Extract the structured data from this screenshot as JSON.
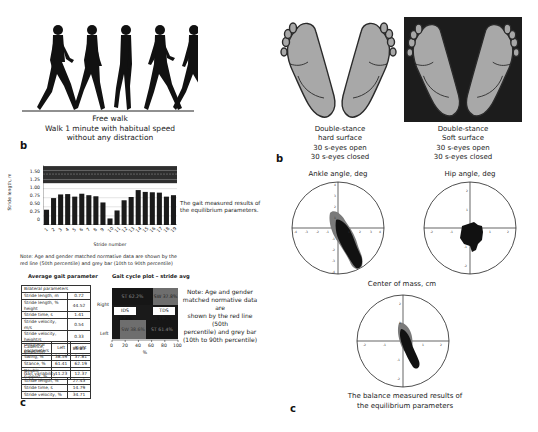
{
  "left_panel": {
    "walk_caption": {
      "line1": "Free walk",
      "line2": "Walk 1 minute with habitual speed",
      "line3": "without any distraction"
    },
    "label_b": "b",
    "label_c": "c",
    "stride_chart_side_text": {
      "line1": "The gait measured results of",
      "line2": "the equilibrium parameters."
    },
    "note": {
      "line1": "Note: Age and gender matched normative data are shown by the",
      "line2": "red line (50th percentile) and grey bar (10th to 90th percentile)"
    },
    "avg_gait_title": "Average gait parameter",
    "gait_cycle_title": "Gait cycle plot – stride avg",
    "bilateral_table": {
      "header": "Bilateral parameters",
      "rows": [
        {
          "label": "Stride length, m",
          "value": "0.72"
        },
        {
          "label": "Stride length, % height",
          "value": "44.52"
        },
        {
          "label": "Stride time, s",
          "value": "1.41"
        },
        {
          "label": "Stride velocity, m/s",
          "value": "0.54"
        },
        {
          "label": "Stride velocity, height/s",
          "value": "0.33"
        },
        {
          "label": "Cadence, steps/min",
          "value": "86.83"
        }
      ]
    },
    "unilateral_table": {
      "headers": [
        "Unilateral parameters",
        "Left",
        "Right"
      ],
      "rows": [
        {
          "label": "Swing, %",
          "left": "38.59",
          "right": "37.81"
        },
        {
          "label": "Stance, %",
          "left": "61.41",
          "right": "62.19"
        },
        {
          "label": "Double support, %",
          "left": "11.23",
          "right": "12.37"
        }
      ]
    },
    "variability_table": {
      "header": "Gait variability",
      "rows": [
        {
          "label": "Stride length, %",
          "value": "27.43"
        },
        {
          "label": "Stride time, s",
          "value": "14.79"
        },
        {
          "label": "Stride velocity, %",
          "value": "34.71"
        }
      ]
    },
    "gait_cycle_plot": {
      "row_labels": [
        "Right",
        "Left"
      ],
      "segments": {
        "right_stance": "ST 62.2%",
        "right_swing": "SW 37.8%",
        "ids": "IDS 12.4%",
        "tds": "TDS 11.2%",
        "left_swing": "SW 38.6%",
        "left_stance": "ST 61.4%"
      },
      "x_ticks": [
        "0",
        "20",
        "40",
        "60",
        "80",
        "100"
      ],
      "x_label": "%"
    },
    "gait_cycle_side_note": {
      "line1": "Note: Age and gender",
      "line2": "matched normative data are",
      "line3": "shown by the red line (50th",
      "line4": "percentile) and grey bar",
      "line5": "(10th to 90th percentile)"
    }
  },
  "right_panel": {
    "hard_surface_caption": {
      "line1": "Double-stance",
      "line2": "hard surface",
      "line3": "30 s-eyes open",
      "line4": "30 s-eyes closed"
    },
    "soft_surface_caption": {
      "line1": "Double-stance",
      "line2": "Soft surface",
      "line3": "30 s-eyes open",
      "line4": "30 s-eyes closed"
    },
    "label_b": "b",
    "label_c": "c",
    "ankle_title": "Ankle angle, deg",
    "hip_title": "Hip angle, deg",
    "com_title": "Center of mass, cm",
    "bottom_caption": {
      "line1": "The balance measured results of",
      "line2": "the equilibrium parameters"
    }
  },
  "chart_data": [
    {
      "type": "bar",
      "title": "",
      "xlabel": "Stride number",
      "ylabel": "Stride length, m",
      "categories": [
        "1",
        "2",
        "3",
        "4",
        "5",
        "6",
        "7",
        "8",
        "9",
        "10",
        "11",
        "12",
        "13",
        "14",
        "15",
        "16",
        "17",
        "18",
        "19"
      ],
      "values": [
        0.42,
        0.74,
        0.84,
        0.85,
        0.78,
        0.86,
        0.82,
        0.79,
        0.62,
        0.18,
        0.4,
        0.68,
        0.77,
        0.96,
        0.91,
        0.9,
        0.89,
        0.78,
        0.82
      ],
      "yticks": [
        "0",
        "0.25",
        "0.50",
        "0.75",
        "1.00",
        "1.25",
        "1.50"
      ],
      "ylim": [
        0,
        1.65
      ],
      "normative_band": {
        "low": 1.15,
        "high": 1.62,
        "median": 1.4
      },
      "grid": true
    },
    {
      "type": "scatter",
      "title": "Ankle angle, deg",
      "xlim": [
        -4,
        4
      ],
      "ylim": [
        -4,
        4
      ],
      "xticks": [
        "-4",
        "-3",
        "-2",
        "-1",
        "1",
        "2",
        "3",
        "4"
      ],
      "yticks": [
        "4",
        "3",
        "2",
        "1",
        "-1",
        "-2",
        "-3",
        "-4"
      ]
    },
    {
      "type": "scatter",
      "title": "Hip angle, deg",
      "xlim": [
        -2,
        2
      ],
      "ylim": [
        -2,
        2
      ],
      "xticks": [
        "-2",
        "-1",
        "1",
        "2"
      ],
      "yticks": [
        "2",
        "1",
        "-1",
        "-2"
      ]
    },
    {
      "type": "scatter",
      "title": "Center of mass, cm",
      "xlim": [
        -2,
        2
      ],
      "ylim": [
        -2,
        2
      ],
      "xticks": [
        "-2",
        "-1",
        "1",
        "2"
      ],
      "yticks": [
        "2",
        "1",
        "-1",
        "-2"
      ]
    }
  ]
}
